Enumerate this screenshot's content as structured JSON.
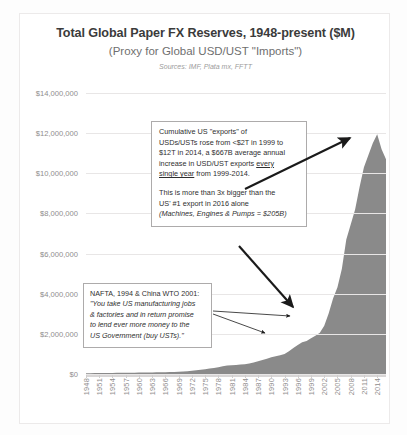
{
  "chart_data": {
    "type": "area",
    "title": "Total Global Paper FX Reserves, 1948-present ($M)",
    "subtitle": "(Proxy for Global USD/UST \"Imports\")",
    "sources": "Sources: IMF, Plata mx, FFTT",
    "xlabel": "",
    "ylabel": "",
    "ylim": [
      0,
      14000000
    ],
    "ytick_labels": [
      "$14,000,000",
      "$12,000,000",
      "$10,000,000",
      "$8,000,000",
      "$6,000,000",
      "$4,000,000",
      "$2,000,000",
      "$0"
    ],
    "ytick_values": [
      14000000,
      12000000,
      10000000,
      8000000,
      6000000,
      4000000,
      2000000,
      0
    ],
    "grid": true,
    "legend": "none",
    "series_name": "Total Global Paper FX Reserves",
    "series_color": "#8a8a8a",
    "xtick_labels": [
      "1948",
      "1951",
      "1954",
      "1957",
      "1960",
      "1963",
      "1966",
      "1969",
      "1972",
      "1975",
      "1978",
      "1981",
      "1984",
      "1987",
      "1990",
      "1993",
      "1996",
      "1999",
      "2002",
      "2005",
      "2008",
      "2011",
      "2014"
    ],
    "x": [
      1948,
      1949,
      1950,
      1951,
      1952,
      1953,
      1954,
      1955,
      1956,
      1957,
      1958,
      1959,
      1960,
      1961,
      1962,
      1963,
      1964,
      1965,
      1966,
      1967,
      1968,
      1969,
      1970,
      1971,
      1972,
      1973,
      1974,
      1975,
      1976,
      1977,
      1978,
      1979,
      1980,
      1981,
      1982,
      1983,
      1984,
      1985,
      1986,
      1987,
      1988,
      1989,
      1990,
      1991,
      1992,
      1993,
      1994,
      1995,
      1996,
      1997,
      1998,
      1999,
      2000,
      2001,
      2002,
      2003,
      2004,
      2005,
      2006,
      2007,
      2008,
      2009,
      2010,
      2011,
      2012,
      2013,
      2014,
      2015,
      2016
    ],
    "values": [
      40000,
      42000,
      45000,
      48000,
      50000,
      52000,
      55000,
      57000,
      60000,
      62000,
      64000,
      66000,
      70000,
      73000,
      76000,
      80000,
      84000,
      88000,
      92000,
      96000,
      102000,
      108000,
      120000,
      140000,
      165000,
      190000,
      215000,
      240000,
      270000,
      300000,
      340000,
      380000,
      420000,
      440000,
      450000,
      470000,
      490000,
      520000,
      570000,
      640000,
      700000,
      760000,
      830000,
      880000,
      930000,
      1000000,
      1130000,
      1300000,
      1450000,
      1580000,
      1650000,
      1780000,
      1900000,
      2050000,
      2400000,
      3020000,
      3760000,
      4320000,
      5250000,
      6700000,
      7450000,
      8200000,
      9300000,
      10300000,
      10900000,
      11500000,
      11950000,
      11200000,
      10700000
    ],
    "peak_year": 2014,
    "peak_value": 11950000
  },
  "annotations": [
    {
      "id": "callout-exports",
      "lines": [
        "Cumulative US \"exports\" of",
        "USDs/USTs rose from <$2T in 1999 to",
        "$12T in 2014, a $667B average annual",
        "increase in USD/UST exports every",
        "single year from 1999-2014."
      ],
      "line1": "Cumulative US \"exports\" of",
      "line2": "USDs/USTs rose from <$2T in 1999 to",
      "line3": "$12T in 2014, a $667B average annual",
      "line4a": "increase in USD/UST exports ",
      "line4b": "every",
      "line5a": "single year",
      "line5b": " from 1999-2014.",
      "para2_line1": "This is more than 3x bigger than the",
      "para2_line2": "US' #1 export in 2016 alone",
      "para2_line3": "(Machines, Engines & Pumps = $205B)"
    },
    {
      "id": "callout-nafta",
      "heading": "NAFTA, 1994 & China WTO 2001:",
      "quote_line1": "\"You take US manufacturing jobs",
      "quote_line2": "& factories and in return promise",
      "quote_line3": "to lend ever more money to the",
      "quote_line4": "US Government (buy USTs).\""
    }
  ],
  "colors": {
    "area_fill": "#8a8a8a",
    "grid": "#e8e6e6",
    "title_text": "#3b3b3b",
    "axis_text": "#8f8d8d",
    "callout_border": "#adabab",
    "arrow": "#1a1a1a"
  }
}
